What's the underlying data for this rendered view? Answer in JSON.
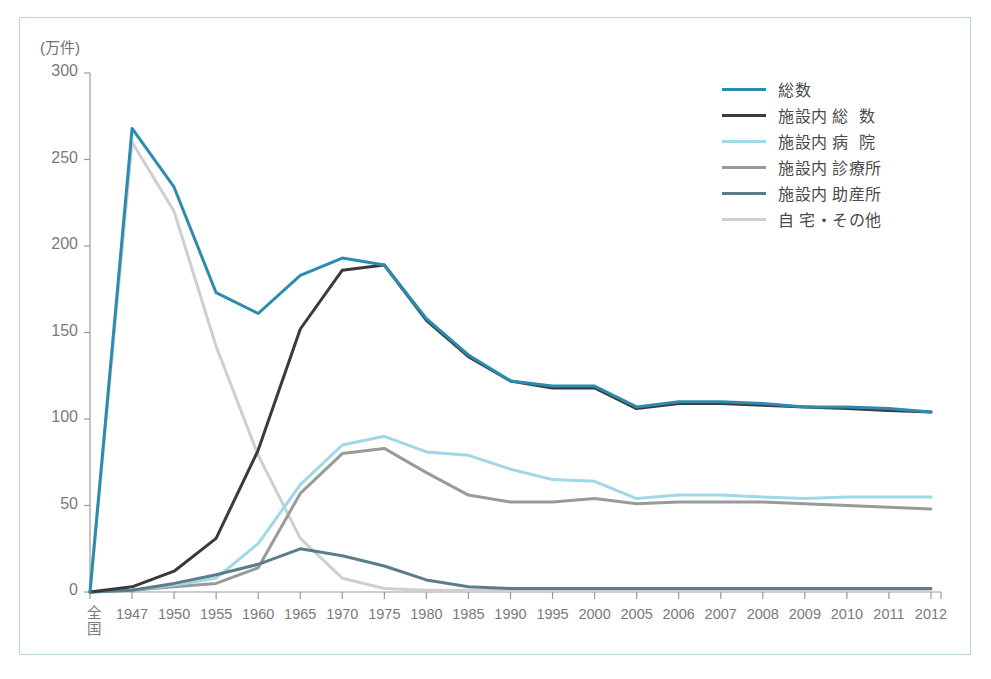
{
  "figure": {
    "border_color": "#b8d4dd",
    "background": "#ffffff"
  },
  "chart_data": {
    "type": "line",
    "title": "",
    "subtitle": "",
    "xlabel": "",
    "ylabel": "(万件)",
    "ylim": [
      0,
      300
    ],
    "yticks": [
      0,
      50,
      100,
      150,
      200,
      250,
      300
    ],
    "ytick_labels": [
      "0",
      "50",
      "100",
      "150",
      "200",
      "250",
      "300"
    ],
    "grid": false,
    "legend_position": "top-right",
    "categories": [
      "全国",
      "1947",
      "1950",
      "1955",
      "1960",
      "1965",
      "1970",
      "1975",
      "1980",
      "1985",
      "1990",
      "1995",
      "2000",
      "2005",
      "2006",
      "2007",
      "2008",
      "2009",
      "2010",
      "2011",
      "2012"
    ],
    "x_first_label_lines": [
      "全",
      "国"
    ],
    "series": [
      {
        "name": "総数",
        "color": "#2b8cb0",
        "width": 3,
        "values": [
          0,
          268,
          234,
          173,
          161,
          183,
          193,
          189,
          158,
          137,
          122,
          119,
          119,
          107,
          110,
          110,
          109,
          107,
          107,
          106,
          104
        ]
      },
      {
        "name": "施設内 総  数",
        "color": "#3a3a3a",
        "width": 3,
        "values": [
          0,
          3,
          12,
          31,
          82,
          152,
          186,
          189,
          157,
          136,
          122,
          118,
          118,
          106,
          109,
          109,
          108,
          107,
          106,
          105,
          104
        ]
      },
      {
        "name": "施設内 病  院",
        "color": "#9fd8e8",
        "width": 3,
        "values": [
          0,
          1,
          4,
          8,
          28,
          62,
          85,
          90,
          81,
          79,
          71,
          65,
          64,
          54,
          56,
          56,
          55,
          54,
          55,
          55,
          55
        ]
      },
      {
        "name": "施設内 診療所",
        "color": "#9a9a9a",
        "width": 3,
        "values": [
          0,
          1,
          3,
          5,
          14,
          57,
          80,
          83,
          69,
          56,
          52,
          52,
          54,
          51,
          52,
          52,
          52,
          51,
          50,
          49,
          48
        ]
      },
      {
        "name": "施設内 助産所",
        "color": "#5a7d8c",
        "width": 3,
        "values": [
          0,
          1,
          5,
          10,
          16,
          25,
          21,
          15,
          7,
          3,
          2,
          2,
          2,
          2,
          2,
          2,
          2,
          2,
          2,
          2,
          2
        ]
      },
      {
        "name": "自 宅・その他",
        "color": "#cfcfcf",
        "width": 3,
        "values": [
          0,
          260,
          220,
          142,
          79,
          31,
          8,
          2,
          1,
          1,
          1,
          1,
          1,
          1,
          1,
          1,
          1,
          1,
          1,
          1,
          1
        ]
      }
    ]
  },
  "legend": {
    "items": [
      {
        "label": "総数",
        "color": "#2b8cb0"
      },
      {
        "label": "施設内 総  数",
        "color": "#3a3a3a"
      },
      {
        "label": "施設内 病  院",
        "color": "#9fd8e8"
      },
      {
        "label": "施設内 診療所",
        "color": "#9a9a9a"
      },
      {
        "label": "施設内 助産所",
        "color": "#5a7d8c"
      },
      {
        "label": "自 宅・その他",
        "color": "#cfcfcf"
      }
    ]
  },
  "axis": {
    "unit_label": "(万件)",
    "axis_color": "#9a9a9a"
  }
}
